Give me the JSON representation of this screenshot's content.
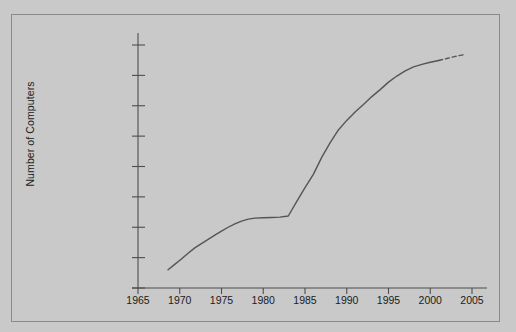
{
  "chart_data": {
    "type": "line",
    "title": "",
    "xlabel": "",
    "ylabel": "Number of Computers",
    "yscale": "log",
    "xlim": [
      1965,
      2005
    ],
    "ylim": [
      1,
      100000000
    ],
    "grid": false,
    "legend": null,
    "y_tick_labels": [
      "100,000,000",
      "10,000,000",
      "1,000,000",
      "100,000",
      "10,000",
      "1,000",
      "100",
      "10",
      "1"
    ],
    "y_tick_values": [
      100000000,
      10000000,
      1000000,
      100000,
      10000,
      1000,
      100,
      10,
      1
    ],
    "x_tick_labels": [
      "1965",
      "1970",
      "1975",
      "1980",
      "1985",
      "1990",
      "1995",
      "2000",
      "2005"
    ],
    "x_tick_values": [
      1965,
      1970,
      1975,
      1980,
      1985,
      1990,
      1995,
      2000,
      2005
    ],
    "series": [
      {
        "name": "Hosts on the Internet",
        "style": "solid",
        "color": "#555555",
        "x": [
          1968.6,
          1969.4,
          1970.2,
          1971.0,
          1971.8,
          1972.6,
          1973.4,
          1974.2,
          1975.0,
          1975.8,
          1976.6,
          1977.4,
          1978.2,
          1979.0,
          1980.0,
          1981.0,
          1982.0,
          1983.0,
          1984.0,
          1985.0,
          1986.0,
          1987.0,
          1988.0,
          1989.0,
          1990.0,
          1991.0,
          1992.0,
          1993.0,
          1994.0,
          1995.0,
          1996.0,
          1997.0,
          1998.0,
          1999.0,
          2000.0,
          2001.0
        ],
        "y": [
          4,
          6,
          9,
          14,
          21,
          29,
          40,
          55,
          75,
          100,
          130,
          160,
          185,
          200,
          205,
          210,
          215,
          235,
          700,
          2000,
          5500,
          20000,
          60000,
          160000,
          330000,
          620000,
          1100000,
          2000000,
          3400000,
          6000000,
          9500000,
          14000000,
          19000000,
          23000000,
          27000000,
          31000000
        ]
      },
      {
        "name": "Projection",
        "style": "dashed",
        "color": "#555555",
        "x": [
          2001.0,
          2002.0,
          2003.0,
          2004.0
        ],
        "y": [
          31000000,
          36000000,
          42000000,
          48000000
        ]
      }
    ]
  },
  "axis": {
    "y_title": "Number of Computers"
  }
}
